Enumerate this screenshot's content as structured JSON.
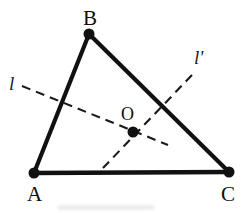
{
  "figure": {
    "type": "geometry-diagram",
    "width": 245,
    "height": 213,
    "background_color": "#ffffff",
    "stroke_color": "#111111"
  },
  "labels": {
    "vertex_a": "A",
    "vertex_b": "B",
    "vertex_c": "C",
    "point_o": "O",
    "line_l": "l",
    "line_l_prime": "l'"
  },
  "geometry": {
    "vertices": [
      {
        "name": "A",
        "x": 34,
        "y": 173
      },
      {
        "name": "B",
        "x": 89,
        "y": 34
      },
      {
        "name": "C",
        "x": 229,
        "y": 172
      }
    ],
    "interior_points": [
      {
        "name": "O",
        "x": 133,
        "y": 132
      }
    ],
    "edges": [
      {
        "name": "AB",
        "from": "A",
        "to": "B"
      },
      {
        "name": "BC",
        "from": "B",
        "to": "C"
      },
      {
        "name": "AC",
        "from": "A",
        "to": "C"
      }
    ],
    "dashed_lines": [
      {
        "name": "l",
        "x1": 22,
        "y1": 86,
        "x2": 168,
        "y2": 145,
        "dash_pattern": "9 6"
      },
      {
        "name": "l'",
        "x1": 192,
        "y1": 75,
        "x2": 103,
        "y2": 168,
        "dash_pattern": "9 6"
      }
    ],
    "dot_radius": 5.5,
    "edge_stroke_width": 4.2,
    "dashed_stroke_width": 2.1
  }
}
